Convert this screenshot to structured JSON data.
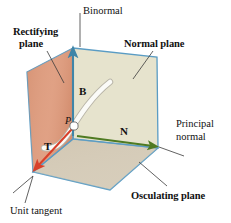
{
  "figure": {
    "background": "#ffffff"
  },
  "labels": {
    "binormal": "Binormal",
    "rectifying_plane_line1": "Rectifying",
    "rectifying_plane_line2": "plane",
    "normal_plane": "Normal plane",
    "principal_normal_line1": "Principal",
    "principal_normal_line2": "normal",
    "osculating_plane": "Osculating plane",
    "unit_tangent": "Unit tangent",
    "vector_b": "B",
    "vector_n": "N",
    "vector_t": "T",
    "point_p": "P"
  },
  "colors": {
    "edge_blue": "#5a9cc4",
    "rectifying_fill": "#de9d80",
    "normal_fill": "#e6e3cd",
    "osculating_fill": "#d5cbb8",
    "vector_t": "#d8402a",
    "vector_n": "#4f7a22",
    "vector_b": "#3f85a8",
    "curve_white": "#fbfbf8",
    "curve_outline": "#b9b5a8",
    "leader_line": "#3a3a3a",
    "text": "#111111"
  },
  "geometry": {
    "description": "Three mutually perpendicular planes of a space curve meeting at point P",
    "vertices": {
      "top_back": [
        73,
        48
      ],
      "left_top": [
        27,
        72
      ],
      "left_bottom": [
        27,
        160
      ],
      "bottom_left": [
        33,
        172
      ],
      "top_right": [
        157,
        57
      ],
      "right_bottom": [
        158,
        148
      ],
      "bottom_front": [
        110,
        190
      ],
      "bottom_back": [
        73,
        139
      ],
      "point_p": [
        74,
        125
      ]
    },
    "vectors": [
      {
        "name": "B",
        "from": [
          73,
          139
        ],
        "to": [
          73,
          50
        ],
        "color": "#3f85a8"
      },
      {
        "name": "N",
        "from": [
          76,
          136
        ],
        "to": [
          157,
          147
        ],
        "color": "#4f7a22"
      },
      {
        "name": "T",
        "from": [
          72,
          130
        ],
        "to": [
          34,
          170
        ],
        "color": "#d8402a"
      }
    ]
  },
  "leaders": [
    {
      "name": "binormal-leader",
      "from": [
        80,
        13
      ],
      "to": [
        80,
        48
      ]
    },
    {
      "name": "rectifying-leader",
      "from": [
        47,
        50
      ],
      "to": [
        64,
        82
      ]
    },
    {
      "name": "normal-plane-leader",
      "from": [
        152,
        50
      ],
      "to": [
        133,
        78
      ]
    },
    {
      "name": "principal-normal-leader",
      "from": [
        180,
        155
      ],
      "to": [
        158,
        148
      ]
    },
    {
      "name": "osculating-leader",
      "from": [
        165,
        185
      ],
      "to": [
        140,
        163
      ]
    },
    {
      "name": "unit-tangent-leader-a",
      "from": [
        14,
        205
      ],
      "to": [
        33,
        176
      ]
    },
    {
      "name": "unit-tangent-leader-b",
      "from": [
        28,
        208
      ],
      "to": [
        33,
        176
      ]
    }
  ]
}
